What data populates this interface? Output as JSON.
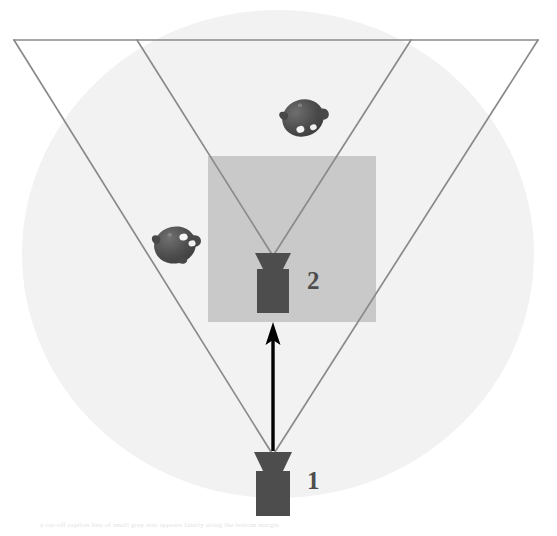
{
  "figure": {
    "type": "camera-view-frustum-diagram",
    "canvas": {
      "width": 557,
      "height": 536,
      "background": "#ffffff"
    },
    "scene_region": {
      "name": "scene-sphere",
      "shape": "ellipse",
      "color": "#f2f2f2",
      "cx": 278,
      "cy": 254,
      "rx": 256,
      "ry": 244
    },
    "roi_region": {
      "name": "region-of-interest",
      "shape": "rectangle",
      "color": "#c9c9c9",
      "x": 208,
      "y": 156,
      "width": 168,
      "height": 166
    },
    "frustums": [
      {
        "id": "frustum-2",
        "label": "2",
        "apex_x": 273,
        "apex_y": 256,
        "top_left_x": 137,
        "top_right_x": 411,
        "top_y": 40,
        "stroke": "#8a8a8a",
        "stroke_width": 1.6
      },
      {
        "id": "frustum-1",
        "label": "1",
        "apex_x": 273,
        "apex_y": 455,
        "top_left_x": 14,
        "top_right_x": 538,
        "top_y": 40,
        "stroke": "#8a8a8a",
        "stroke_width": 1.6
      }
    ],
    "image_plane_line": {
      "name": "image-plane-line",
      "x1": 14,
      "x2": 538,
      "y": 40,
      "stroke": "#8a8a8a"
    },
    "cameras": [
      {
        "id": "camera-2",
        "label": "2",
        "color": "#4d4d4d",
        "lens_top_y": 253,
        "lens_bottom_y": 271,
        "lens_half_width": 18,
        "body_x": 257,
        "body_y": 270,
        "body_width": 32,
        "body_height": 43,
        "label_x": 307,
        "label_y": 268
      },
      {
        "id": "camera-1",
        "label": "1",
        "color": "#4d4d4d",
        "lens_top_y": 452,
        "lens_bottom_y": 472,
        "lens_half_width": 19,
        "body_x": 256,
        "body_y": 471,
        "body_width": 34,
        "body_height": 45,
        "label_x": 307,
        "label_y": 468
      }
    ],
    "motion_arrow": {
      "name": "camera-motion-arrow",
      "from_x": 273,
      "from_y": 451,
      "to_x": 273,
      "to_y": 325,
      "color": "#000000",
      "stroke_width": 3,
      "head_width": 14,
      "head_length": 24,
      "direction": "up"
    },
    "objects": [
      {
        "id": "scene-object-upper",
        "color": "#4a4a4a",
        "cx": 303,
        "cy": 118,
        "rx": 21,
        "ry": 19,
        "rotation": -18
      },
      {
        "id": "scene-object-lower",
        "color": "#4a4a4a",
        "cx": 175,
        "cy": 245,
        "rx": 21,
        "ry": 19,
        "rotation": -12
      }
    ],
    "caption": "a cut-off caption line of small grey text appears faintly along the bottom margin"
  },
  "labels": {
    "camera_1": "1",
    "camera_2": "2"
  },
  "colors": {
    "background": "#ffffff",
    "scene_sphere": "#f2f2f2",
    "roi_rectangle": "#c9c9c9",
    "frustum_stroke": "#8a8a8a",
    "camera_body": "#4d4d4d",
    "object_body": "#4a4a4a",
    "arrow": "#000000",
    "label_text": "#4d4d4d"
  }
}
